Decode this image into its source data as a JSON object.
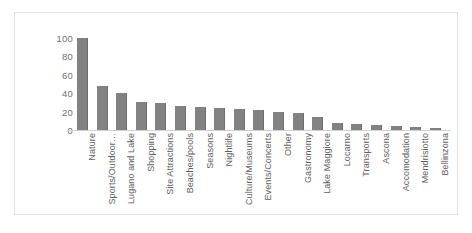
{
  "chart_data": {
    "type": "bar",
    "title": "",
    "xlabel": "",
    "ylabel": "",
    "ylim": [
      0,
      100
    ],
    "yticks": [
      100,
      80,
      60,
      40,
      20,
      0
    ],
    "grid": false,
    "legend": false,
    "bar_color": "#828282",
    "categories": [
      "Nature",
      "Sports/Outdoor…",
      "Lugano and Lake",
      "Shopping",
      "Site Attractions",
      "Beaches/pools",
      "Seasons",
      "Nightlife",
      "Culture/Museums",
      "Events/Concerts",
      "Other",
      "Gastronomy",
      "Lake Maggiore",
      "Locarno",
      "Transports",
      "Ascona",
      "Accomodation",
      "Mendrisiotto",
      "Bellinzona"
    ],
    "values": [
      100,
      48,
      40,
      30,
      29,
      26,
      25,
      24,
      23,
      22,
      20,
      19,
      14,
      8,
      7,
      5,
      4,
      3,
      2
    ]
  }
}
